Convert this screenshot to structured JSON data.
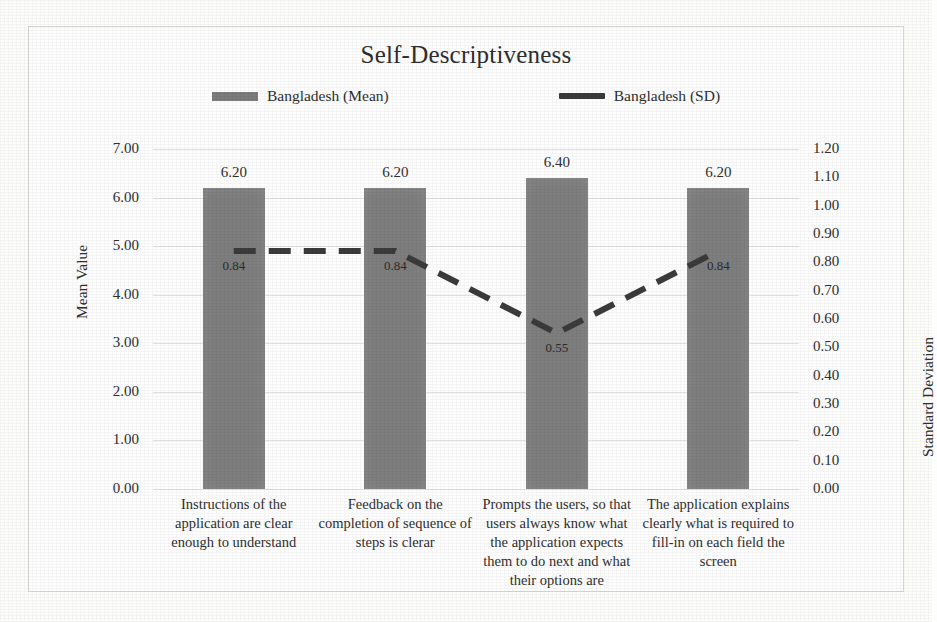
{
  "chart_data": {
    "type": "bar",
    "title": "Self-Descriptiveness",
    "categories": [
      "Instructions of the application are clear enough to understand",
      "Feedback on the completion of sequence of steps is clerar",
      "Prompts the users, so that users always know what the application expects them to do next and what their options are",
      "The application explains clearly what is required to fill-in on each field the screen"
    ],
    "series": [
      {
        "name": "Bangladesh (Mean)",
        "type": "bar",
        "axis": "left",
        "values": [
          6.2,
          6.2,
          6.4,
          6.2
        ],
        "labels": [
          "6.20",
          "6.20",
          "6.40",
          "6.20"
        ],
        "color": "#7e7e7e"
      },
      {
        "name": "Bangladesh (SD)",
        "type": "line",
        "axis": "right",
        "style": "dashed",
        "values": [
          0.84,
          0.84,
          0.55,
          0.84
        ],
        "labels": [
          "0.84",
          "0.84",
          "0.55",
          "0.84"
        ],
        "color": "#3b3b3b"
      }
    ],
    "xlabel": "",
    "ylabel": "Mean Value",
    "ylabel_right": "Standard Deviation",
    "ylim": [
      0,
      7
    ],
    "ylim_right": [
      0,
      1.2
    ],
    "yticks": [
      "0.00",
      "1.00",
      "2.00",
      "3.00",
      "4.00",
      "5.00",
      "6.00",
      "7.00"
    ],
    "yticks_right": [
      "0.00",
      "0.10",
      "0.20",
      "0.30",
      "0.40",
      "0.50",
      "0.60",
      "0.70",
      "0.80",
      "0.90",
      "1.00",
      "1.10",
      "1.20"
    ],
    "grid": true,
    "legend_position": "top"
  },
  "legend": {
    "mean_label": "Bangladesh (Mean)",
    "sd_label": "Bangladesh (SD)"
  }
}
